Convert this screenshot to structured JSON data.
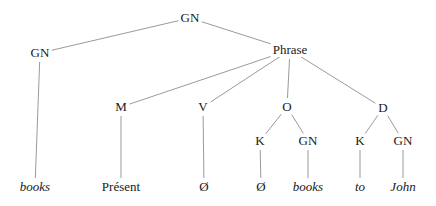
{
  "diagram": {
    "type": "syntax-tree",
    "nodes": [
      {
        "id": "gn_root",
        "label": "GN",
        "x": 190,
        "y": 18,
        "italic": false
      },
      {
        "id": "gn_left",
        "label": "GN",
        "x": 40,
        "y": 53,
        "italic": false
      },
      {
        "id": "phrase",
        "label": "Phrase",
        "x": 290,
        "y": 50,
        "italic": false
      },
      {
        "id": "m",
        "label": "M",
        "x": 121,
        "y": 107,
        "italic": false
      },
      {
        "id": "v",
        "label": "V",
        "x": 203,
        "y": 107,
        "italic": false
      },
      {
        "id": "o",
        "label": "O",
        "x": 287,
        "y": 107,
        "italic": false
      },
      {
        "id": "d",
        "label": "D",
        "x": 383,
        "y": 108,
        "italic": false
      },
      {
        "id": "k_o",
        "label": "K",
        "x": 260,
        "y": 141,
        "italic": false
      },
      {
        "id": "gn_o",
        "label": "GN",
        "x": 308,
        "y": 141,
        "italic": false
      },
      {
        "id": "k_d",
        "label": "K",
        "x": 360,
        "y": 141,
        "italic": false
      },
      {
        "id": "gn_d",
        "label": "GN",
        "x": 403,
        "y": 141,
        "italic": false
      },
      {
        "id": "leaf_books1",
        "label": "books",
        "x": 35,
        "y": 187,
        "italic": true
      },
      {
        "id": "leaf_present",
        "label": "Présent",
        "x": 121,
        "y": 187,
        "italic": false
      },
      {
        "id": "leaf_null_v",
        "label": "Ø",
        "x": 204,
        "y": 187,
        "italic": false
      },
      {
        "id": "leaf_null_k",
        "label": "Ø",
        "x": 261,
        "y": 187,
        "italic": false
      },
      {
        "id": "leaf_books2",
        "label": "books",
        "x": 308,
        "y": 187,
        "italic": true
      },
      {
        "id": "leaf_to",
        "label": "to",
        "x": 360,
        "y": 187,
        "italic": true
      },
      {
        "id": "leaf_john",
        "label": "John",
        "x": 403,
        "y": 187,
        "italic": true
      }
    ],
    "edges": [
      {
        "from": "gn_root",
        "to": "gn_left"
      },
      {
        "from": "gn_root",
        "to": "phrase"
      },
      {
        "from": "gn_left",
        "to": "leaf_books1"
      },
      {
        "from": "phrase",
        "to": "m"
      },
      {
        "from": "phrase",
        "to": "v"
      },
      {
        "from": "phrase",
        "to": "o"
      },
      {
        "from": "phrase",
        "to": "d"
      },
      {
        "from": "m",
        "to": "leaf_present"
      },
      {
        "from": "v",
        "to": "leaf_null_v"
      },
      {
        "from": "o",
        "to": "k_o"
      },
      {
        "from": "o",
        "to": "gn_o"
      },
      {
        "from": "d",
        "to": "k_d"
      },
      {
        "from": "d",
        "to": "gn_d"
      },
      {
        "from": "k_o",
        "to": "leaf_null_k"
      },
      {
        "from": "gn_o",
        "to": "leaf_books2"
      },
      {
        "from": "k_d",
        "to": "leaf_to"
      },
      {
        "from": "gn_d",
        "to": "leaf_john"
      }
    ],
    "colors": {
      "line": "#9a9a9a",
      "text": "#1a1a1a",
      "background": "#ffffff"
    }
  }
}
